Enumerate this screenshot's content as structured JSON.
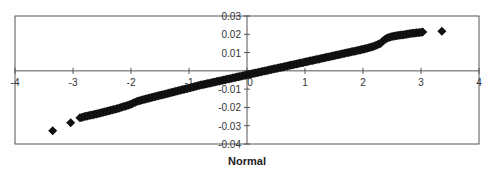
{
  "chart_data": {
    "type": "scatter",
    "title": "",
    "xlabel": "Normal",
    "ylabel": "",
    "xlim": [
      -4,
      4
    ],
    "ylim": [
      -0.04,
      0.03
    ],
    "x_ticks": [
      -4,
      -3,
      -2,
      -1,
      0,
      1,
      2,
      3,
      4
    ],
    "x_tick_labels": [
      "-4",
      "-3",
      "-2",
      "-1",
      "0",
      "1",
      "2",
      "3",
      "4"
    ],
    "y_ticks": [
      0.03,
      0.02,
      0.01,
      0,
      -0.01,
      -0.02,
      -0.03,
      -0.04
    ],
    "y_tick_labels": [
      "0.03",
      "0.02",
      "0.01",
      "",
      "-0.01",
      "-0.02",
      "-0.03",
      "-0.04"
    ],
    "grid": false,
    "legend": null,
    "marker": "diamond",
    "marker_color": "#111111",
    "series": [
      {
        "name": "Normal probability plot",
        "points": [
          [
            -3.35,
            -0.0328
          ],
          [
            -3.04,
            -0.0284
          ],
          [
            -2.88,
            -0.0257
          ],
          [
            -2.8,
            -0.025
          ],
          [
            -2.7,
            -0.0243
          ],
          [
            -2.6,
            -0.0236
          ],
          [
            -2.5,
            -0.0228
          ],
          [
            -2.4,
            -0.022
          ],
          [
            -2.3,
            -0.0212
          ],
          [
            -2.2,
            -0.0203
          ],
          [
            -2.1,
            -0.0193
          ],
          [
            -2.0,
            -0.0182
          ],
          [
            -1.9,
            -0.0168
          ],
          [
            -1.8,
            -0.0158
          ],
          [
            -1.7,
            -0.015
          ],
          [
            -1.6,
            -0.0142
          ],
          [
            -1.5,
            -0.0134
          ],
          [
            -1.4,
            -0.0126
          ],
          [
            -1.3,
            -0.0118
          ],
          [
            -1.2,
            -0.011
          ],
          [
            -1.1,
            -0.0102
          ],
          [
            -1.0,
            -0.0094
          ],
          [
            -0.9,
            -0.0086
          ],
          [
            -0.8,
            -0.0078
          ],
          [
            -0.7,
            -0.0071
          ],
          [
            -0.6,
            -0.0064
          ],
          [
            -0.5,
            -0.0057
          ],
          [
            -0.4,
            -0.005
          ],
          [
            -0.3,
            -0.0043
          ],
          [
            -0.2,
            -0.0036
          ],
          [
            -0.1,
            -0.0029
          ],
          [
            0.0,
            -0.0022
          ],
          [
            0.1,
            -0.0015
          ],
          [
            0.2,
            -0.0008
          ],
          [
            0.3,
            -0.0001
          ],
          [
            0.4,
            0.0006
          ],
          [
            0.5,
            0.0013
          ],
          [
            0.6,
            0.002
          ],
          [
            0.7,
            0.0027
          ],
          [
            0.8,
            0.0034
          ],
          [
            0.9,
            0.0041
          ],
          [
            1.0,
            0.0048
          ],
          [
            1.1,
            0.0055
          ],
          [
            1.2,
            0.0062
          ],
          [
            1.3,
            0.0069
          ],
          [
            1.4,
            0.0076
          ],
          [
            1.5,
            0.0083
          ],
          [
            1.6,
            0.009
          ],
          [
            1.7,
            0.0097
          ],
          [
            1.8,
            0.0104
          ],
          [
            1.9,
            0.0111
          ],
          [
            2.0,
            0.0118
          ],
          [
            2.1,
            0.0126
          ],
          [
            2.2,
            0.0136
          ],
          [
            2.3,
            0.015
          ],
          [
            2.35,
            0.0165
          ],
          [
            2.42,
            0.018
          ],
          [
            2.5,
            0.0188
          ],
          [
            2.6,
            0.0193
          ],
          [
            2.7,
            0.0198
          ],
          [
            2.8,
            0.0203
          ],
          [
            2.9,
            0.0207
          ],
          [
            3.03,
            0.0212
          ],
          [
            3.36,
            0.0217
          ]
        ]
      }
    ]
  }
}
